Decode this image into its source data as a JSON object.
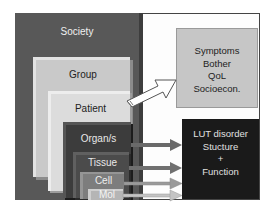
{
  "diagram": {
    "levels": [
      {
        "label": "Society",
        "color": "#585858",
        "text_color": "#f0f0f0"
      },
      {
        "label": "Group",
        "color": "#c9c9c9",
        "text_color": "#222222"
      },
      {
        "label": "Patient",
        "color": "#dcdcdc",
        "text_color": "#222222"
      },
      {
        "label": "Organ/s",
        "color": "#3c3c3c",
        "text_color": "#e8e8e8"
      },
      {
        "label": "Tissue",
        "color": "#4b4b4b",
        "text_color": "#e8e8e8"
      },
      {
        "label": "Cell",
        "color": "#7d7d7d",
        "text_color": "#eeeeee"
      },
      {
        "label": "Mol",
        "color": "#b5b5b5",
        "text_color": "#f4f4f4"
      }
    ],
    "outcome_patient": {
      "lines": [
        "Symptoms",
        "Bother",
        "QoL",
        "Socioecon."
      ],
      "color": "#c6c6c6"
    },
    "outcome_biology": {
      "lines": [
        "LUT disorder",
        "Stucture",
        "+",
        "Function"
      ],
      "color": "#1a1a1a"
    },
    "arrows": [
      {
        "from": "Patient",
        "to": "outcome_patient",
        "style": "hollow-outline"
      },
      {
        "from": "Organ/s",
        "to": "outcome_biology",
        "style": "filled-gray"
      },
      {
        "from": "Tissue",
        "to": "outcome_biology",
        "style": "filled-gray"
      },
      {
        "from": "Cell",
        "to": "outcome_biology",
        "style": "filled-light"
      },
      {
        "from": "Mol",
        "to": "outcome_biology",
        "style": "filled-light"
      }
    ]
  }
}
